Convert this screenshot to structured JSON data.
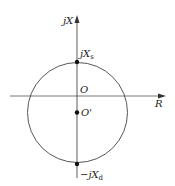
{
  "diagram": {
    "type": "impedance-circle",
    "axes": {
      "vertical_label": "jX",
      "horizontal_label": "R"
    },
    "points": {
      "origin": "O",
      "center": "O'",
      "top": {
        "prefix": "jX",
        "sub": "s"
      },
      "bottom": {
        "prefix": "−jX",
        "sub": "d"
      }
    },
    "colors": {
      "line": "#333333",
      "background": "#ffffff"
    }
  }
}
